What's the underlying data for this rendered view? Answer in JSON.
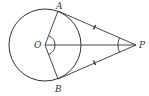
{
  "diagram": {
    "type": "geometry",
    "colors": {
      "stroke": "#333333",
      "background": "#ffffff"
    },
    "circle": {
      "center": "O",
      "cx": 45,
      "cy": 45,
      "r": 36
    },
    "points": {
      "O": {
        "label": "O",
        "x": 45,
        "y": 45
      },
      "A": {
        "label": "A",
        "x": 58,
        "y": 11
      },
      "B": {
        "label": "B",
        "x": 58,
        "y": 79
      },
      "P": {
        "label": "P",
        "x": 136,
        "y": 45
      }
    },
    "segments": [
      {
        "from": "O",
        "to": "A"
      },
      {
        "from": "O",
        "to": "B"
      },
      {
        "from": "O",
        "to": "P"
      },
      {
        "from": "A",
        "to": "P",
        "tick": "single"
      },
      {
        "from": "B",
        "to": "P",
        "tick": "single"
      }
    ],
    "angle_marks": [
      {
        "vertex": "O",
        "between": [
          "A",
          "B"
        ]
      },
      {
        "vertex": "P",
        "between": [
          "A",
          "B"
        ]
      }
    ]
  }
}
